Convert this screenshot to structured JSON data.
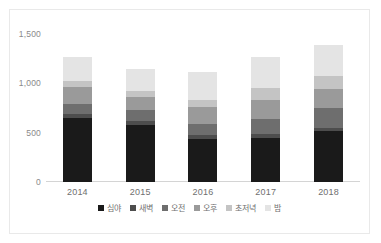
{
  "chart_data": {
    "type": "bar",
    "subtype": "stacked-vertical",
    "title": "",
    "xlabel": "",
    "ylabel": "",
    "categories": [
      "2014",
      "2015",
      "2016",
      "2017",
      "2018"
    ],
    "ylim": [
      0,
      1500
    ],
    "yticks": [
      0,
      500,
      1000,
      1500
    ],
    "ytick_labels": [
      "0",
      "500",
      "1,000",
      "1,500"
    ],
    "grid": false,
    "legend_position": "bottom",
    "series": [
      {
        "name": "심야",
        "color": "#1a1a1a",
        "values": [
          650,
          580,
          440,
          450,
          520
        ]
      },
      {
        "name": "새벽",
        "color": "#4d4d4d",
        "values": [
          40,
          35,
          35,
          40,
          30
        ]
      },
      {
        "name": "오전",
        "color": "#6e6e6e",
        "values": [
          100,
          115,
          110,
          145,
          200
        ]
      },
      {
        "name": "오후",
        "color": "#9a9a9a",
        "values": [
          170,
          130,
          175,
          200,
          190
        ]
      },
      {
        "name": "초저녁",
        "color": "#c4c4c4",
        "values": [
          65,
          60,
          70,
          120,
          135
        ]
      },
      {
        "name": "밤",
        "color": "#e4e4e4",
        "values": [
          240,
          230,
          290,
          310,
          310
        ]
      }
    ],
    "totals": [
      1265,
      1150,
      1120,
      1265,
      1385
    ]
  },
  "axis": {
    "y_tick_labels": [
      "1,500",
      "1,000",
      "500",
      "0"
    ]
  },
  "colors": {
    "background": "#ffffff",
    "frame_border": "#e9e9e9",
    "axis_line": "#d4d4d4",
    "tick_text": "#8a8a8a",
    "category_text": "#6f6f6f",
    "legend_text": "#6f6f6f"
  }
}
